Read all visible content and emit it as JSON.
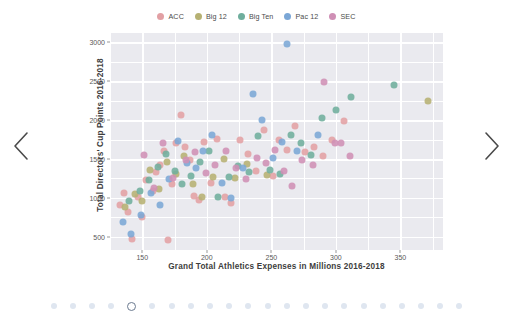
{
  "carousel": {
    "prev_label": "Previous",
    "prev_icon": "chevron-left-icon",
    "next_label": "Next",
    "next_icon": "chevron-right-icon",
    "total_dots": 22,
    "active_dot_index": 4
  },
  "chart_data": {
    "type": "scatter",
    "title": "",
    "xlabel": "Grand Total Athletics Expenses in Millions 2016-2018",
    "ylabel": "Total Directors' Cup Points 2016-2018",
    "xlim": [
      125,
      383
    ],
    "ylim": [
      330,
      3120
    ],
    "xticks": [
      150,
      200,
      250,
      300,
      350
    ],
    "yticks": [
      500,
      1000,
      1500,
      2000,
      2500,
      3000
    ],
    "grid": true,
    "legend_position": "top-center",
    "plot_background": "#eaeaef",
    "grid_color": "#ffffff",
    "legend": [
      {
        "name": "ACC",
        "color": "#e2a0a4"
      },
      {
        "name": "Big 12",
        "color": "#b6b173"
      },
      {
        "name": "Big Ten",
        "color": "#6fae9d"
      },
      {
        "name": "Pac 12",
        "color": "#7ba7d6"
      },
      {
        "name": "SEC",
        "color": "#cf8fb5"
      }
    ],
    "series": [
      {
        "name": "ACC",
        "color": "#e2a0a4",
        "points": [
          [
            133,
            905
          ],
          [
            136,
            1060
          ],
          [
            139,
            820
          ],
          [
            142,
            470
          ],
          [
            147,
            1010
          ],
          [
            150,
            760
          ],
          [
            153,
            1230
          ],
          [
            158,
            1090
          ],
          [
            161,
            1330
          ],
          [
            164,
            1420
          ],
          [
            167,
            1600
          ],
          [
            170,
            455
          ],
          [
            173,
            1180
          ],
          [
            176,
            1700
          ],
          [
            180,
            2060
          ],
          [
            183,
            1650
          ],
          [
            187,
            1490
          ],
          [
            190,
            1030
          ],
          [
            194,
            975
          ],
          [
            198,
            1720
          ],
          [
            203,
            1190
          ],
          [
            208,
            1760
          ],
          [
            214,
            1010
          ],
          [
            219,
            930
          ],
          [
            226,
            1750
          ],
          [
            232,
            1560
          ],
          [
            238,
            1345
          ],
          [
            244,
            1870
          ],
          [
            251,
            1280
          ],
          [
            256,
            1745
          ],
          [
            262,
            1615
          ],
          [
            268,
            1930
          ],
          [
            276,
            1595
          ],
          [
            283,
            1650
          ],
          [
            290,
            1545
          ],
          [
            297,
            1745
          ],
          [
            306,
            1985
          ]
        ]
      },
      {
        "name": "Big 12",
        "color": "#b6b173",
        "points": [
          [
            137,
            880
          ],
          [
            144,
            1050
          ],
          [
            150,
            965
          ],
          [
            156,
            1360
          ],
          [
            163,
            1120
          ],
          [
            169,
            1465
          ],
          [
            176,
            1310
          ],
          [
            182,
            1545
          ],
          [
            189,
            1180
          ],
          [
            196,
            1010
          ],
          [
            205,
            1270
          ],
          [
            213,
            1500
          ],
          [
            222,
            1250
          ],
          [
            231,
            1430
          ],
          [
            247,
            1300
          ],
          [
            371,
            2245
          ]
        ]
      },
      {
        "name": "Big Ten",
        "color": "#6fae9d",
        "points": [
          [
            140,
            955
          ],
          [
            148,
            1085
          ],
          [
            155,
            1230
          ],
          [
            162,
            1400
          ],
          [
            168,
            1565
          ],
          [
            175,
            1350
          ],
          [
            181,
            1180
          ],
          [
            188,
            1285
          ],
          [
            195,
            1460
          ],
          [
            202,
            1600
          ],
          [
            209,
            1010
          ],
          [
            217,
            1275
          ],
          [
            224,
            1405
          ],
          [
            233,
            1330
          ],
          [
            240,
            1800
          ],
          [
            249,
            1355
          ],
          [
            257,
            1310
          ],
          [
            265,
            1815
          ],
          [
            273,
            1700
          ],
          [
            281,
            1555
          ],
          [
            289,
            2030
          ],
          [
            300,
            2130
          ],
          [
            312,
            2295
          ],
          [
            345,
            2455
          ]
        ]
      },
      {
        "name": "Pac 12",
        "color": "#7ba7d6",
        "points": [
          [
            135,
            690
          ],
          [
            141,
            535
          ],
          [
            149,
            780
          ],
          [
            157,
            1065
          ],
          [
            164,
            905
          ],
          [
            171,
            1245
          ],
          [
            178,
            1730
          ],
          [
            185,
            1445
          ],
          [
            192,
            1385
          ],
          [
            197,
            1605
          ],
          [
            204,
            1810
          ],
          [
            212,
            1190
          ],
          [
            219,
            1000
          ],
          [
            228,
            1390
          ],
          [
            236,
            2335
          ],
          [
            243,
            2005
          ],
          [
            251,
            1510
          ],
          [
            258,
            1720
          ],
          [
            262,
            2980
          ],
          [
            270,
            1600
          ],
          [
            286,
            1805
          ]
        ]
      },
      {
        "name": "SEC",
        "color": "#cf8fb5",
        "points": [
          [
            151,
            1555
          ],
          [
            159,
            1125
          ],
          [
            166,
            1700
          ],
          [
            174,
            1255
          ],
          [
            184,
            1490
          ],
          [
            191,
            1595
          ],
          [
            199,
            1320
          ],
          [
            206,
            1420
          ],
          [
            215,
            1605
          ],
          [
            223,
            1385
          ],
          [
            230,
            1245
          ],
          [
            239,
            1510
          ],
          [
            246,
            1445
          ],
          [
            253,
            1610
          ],
          [
            260,
            1340
          ],
          [
            266,
            1150
          ],
          [
            274,
            1490
          ],
          [
            282,
            1425
          ],
          [
            291,
            2490
          ],
          [
            299,
            1710
          ],
          [
            304,
            1700
          ],
          [
            311,
            1545
          ]
        ]
      }
    ]
  }
}
